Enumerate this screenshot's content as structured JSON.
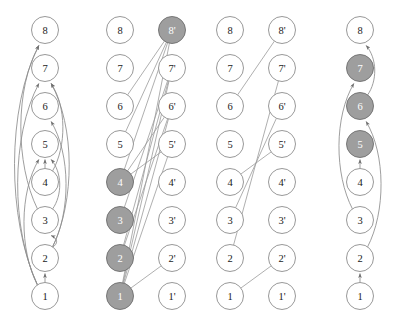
{
  "figure": {
    "title": "",
    "panel_count": 4,
    "colors": {
      "node_fill": "#ffffff",
      "node_shaded_fill": "#9e9e9e",
      "node_stroke": "#8c8c8c",
      "edge_stroke": "#8c8c8c",
      "label": "#1a1a1a",
      "label_on_shaded": "#ffffff",
      "background": "#ffffff"
    },
    "geometry": {
      "node_radius": 13.5,
      "row_y": [
        296,
        258,
        220,
        182,
        144,
        106,
        68,
        30
      ],
      "row_labels_bottom_to_top": [
        "1",
        "2",
        "3",
        "4",
        "5",
        "6",
        "7",
        "8"
      ]
    }
  },
  "panels": [
    {
      "id": "panel-1",
      "name": "digraph-left",
      "type": "directed-graph",
      "columns": [
        {
          "id": "panel1-col-left",
          "x": 45,
          "primed": false,
          "nodes": [
            {
              "label": "8",
              "row": 8,
              "shaded": false
            },
            {
              "label": "7",
              "row": 7,
              "shaded": false
            },
            {
              "label": "6",
              "row": 6,
              "shaded": false
            },
            {
              "label": "5",
              "row": 5,
              "shaded": false
            },
            {
              "label": "4",
              "row": 4,
              "shaded": false
            },
            {
              "label": "3",
              "row": 3,
              "shaded": false
            },
            {
              "label": "2",
              "row": 2,
              "shaded": false
            },
            {
              "label": "1",
              "row": 1,
              "shaded": false
            }
          ]
        }
      ],
      "arcs": [
        {
          "from": "1",
          "to": "2",
          "side": "straight",
          "arrow": true
        },
        {
          "from": "1",
          "to": "7",
          "side": "left",
          "arrow": true
        },
        {
          "from": "1",
          "to": "8",
          "side": "left",
          "arrow": true
        },
        {
          "from": "1",
          "to": "5",
          "side": "left",
          "arrow": true
        },
        {
          "from": "2",
          "to": "3",
          "side": "right",
          "arrow": true
        },
        {
          "from": "2",
          "to": "6",
          "side": "right",
          "arrow": true
        },
        {
          "from": "2",
          "to": "7",
          "side": "right",
          "arrow": true
        },
        {
          "from": "3",
          "to": "5",
          "side": "right",
          "arrow": true
        },
        {
          "from": "4",
          "to": "5",
          "side": "straight",
          "arrow": true
        },
        {
          "from": "3",
          "to": "8",
          "side": "left",
          "arrow": true
        },
        {
          "from": "4",
          "to": "7",
          "side": "right",
          "arrow": true
        }
      ]
    },
    {
      "id": "panel-2",
      "name": "bipartite-shaded",
      "type": "bipartite-graph",
      "columns": [
        {
          "id": "panel2-col-left",
          "x": 120,
          "primed": false,
          "nodes": [
            {
              "label": "8",
              "row": 8,
              "shaded": false
            },
            {
              "label": "7",
              "row": 7,
              "shaded": false
            },
            {
              "label": "6",
              "row": 6,
              "shaded": false
            },
            {
              "label": "5",
              "row": 5,
              "shaded": false
            },
            {
              "label": "4",
              "row": 4,
              "shaded": true
            },
            {
              "label": "3",
              "row": 3,
              "shaded": true
            },
            {
              "label": "2",
              "row": 2,
              "shaded": true
            },
            {
              "label": "1",
              "row": 1,
              "shaded": true
            }
          ]
        },
        {
          "id": "panel2-col-right",
          "x": 172,
          "primed": true,
          "nodes": [
            {
              "label": "8'",
              "row": 8,
              "shaded": true
            },
            {
              "label": "7'",
              "row": 7,
              "shaded": false
            },
            {
              "label": "6'",
              "row": 6,
              "shaded": false
            },
            {
              "label": "5'",
              "row": 5,
              "shaded": false
            },
            {
              "label": "4'",
              "row": 4,
              "shaded": false
            },
            {
              "label": "3'",
              "row": 3,
              "shaded": false
            },
            {
              "label": "2'",
              "row": 2,
              "shaded": false
            },
            {
              "label": "1'",
              "row": 1,
              "shaded": false
            }
          ]
        }
      ],
      "edges": [
        {
          "left": "1",
          "right": "2'"
        },
        {
          "left": "1",
          "right": "5'"
        },
        {
          "left": "1",
          "right": "6'"
        },
        {
          "left": "1",
          "right": "7'"
        },
        {
          "left": "1",
          "right": "8'"
        },
        {
          "left": "2",
          "right": "6'"
        },
        {
          "left": "2",
          "right": "7'"
        },
        {
          "left": "3",
          "right": "7'"
        },
        {
          "left": "4",
          "right": "6'"
        },
        {
          "left": "4",
          "right": "5'"
        },
        {
          "left": "4",
          "right": "8'"
        },
        {
          "left": "6",
          "right": "8'"
        },
        {
          "left": "5",
          "right": "8'"
        }
      ]
    },
    {
      "id": "panel-3",
      "name": "bipartite-matching",
      "type": "bipartite-graph",
      "columns": [
        {
          "id": "panel3-col-left",
          "x": 230,
          "primed": false,
          "nodes": [
            {
              "label": "8",
              "row": 8,
              "shaded": false
            },
            {
              "label": "7",
              "row": 7,
              "shaded": false
            },
            {
              "label": "6",
              "row": 6,
              "shaded": false
            },
            {
              "label": "5",
              "row": 5,
              "shaded": false
            },
            {
              "label": "4",
              "row": 4,
              "shaded": false
            },
            {
              "label": "3",
              "row": 3,
              "shaded": false
            },
            {
              "label": "2",
              "row": 2,
              "shaded": false
            },
            {
              "label": "1",
              "row": 1,
              "shaded": false
            }
          ]
        },
        {
          "id": "panel3-col-right",
          "x": 282,
          "primed": true,
          "nodes": [
            {
              "label": "8'",
              "row": 8,
              "shaded": false
            },
            {
              "label": "7'",
              "row": 7,
              "shaded": false
            },
            {
              "label": "6'",
              "row": 6,
              "shaded": false
            },
            {
              "label": "5'",
              "row": 5,
              "shaded": false
            },
            {
              "label": "4'",
              "row": 4,
              "shaded": false
            },
            {
              "label": "3'",
              "row": 3,
              "shaded": false
            },
            {
              "label": "2'",
              "row": 2,
              "shaded": false
            },
            {
              "label": "1'",
              "row": 1,
              "shaded": false
            }
          ]
        }
      ],
      "edges": [
        {
          "left": "1",
          "right": "2'"
        },
        {
          "left": "2",
          "right": "7'"
        },
        {
          "left": "3",
          "right": "6'"
        },
        {
          "left": "4",
          "right": "5'"
        },
        {
          "left": "6",
          "right": "8'"
        }
      ]
    },
    {
      "id": "panel-4",
      "name": "digraph-right",
      "type": "directed-graph",
      "columns": [
        {
          "id": "panel4-col-left",
          "x": 360,
          "primed": false,
          "nodes": [
            {
              "label": "8",
              "row": 8,
              "shaded": false
            },
            {
              "label": "7",
              "row": 7,
              "shaded": true
            },
            {
              "label": "6",
              "row": 6,
              "shaded": true
            },
            {
              "label": "5",
              "row": 5,
              "shaded": true
            },
            {
              "label": "4",
              "row": 4,
              "shaded": false
            },
            {
              "label": "3",
              "row": 3,
              "shaded": false
            },
            {
              "label": "2",
              "row": 2,
              "shaded": false
            },
            {
              "label": "1",
              "row": 1,
              "shaded": false
            }
          ]
        }
      ],
      "arcs": [
        {
          "from": "1",
          "to": "2",
          "side": "straight",
          "arrow": true
        },
        {
          "from": "4",
          "to": "5",
          "side": "straight",
          "arrow": true
        },
        {
          "from": "3",
          "to": "7",
          "side": "left",
          "arrow": true
        },
        {
          "from": "2",
          "to": "6",
          "side": "right",
          "arrow": true
        },
        {
          "from": "6",
          "to": "8",
          "side": "right",
          "arrow": true
        }
      ]
    }
  ]
}
